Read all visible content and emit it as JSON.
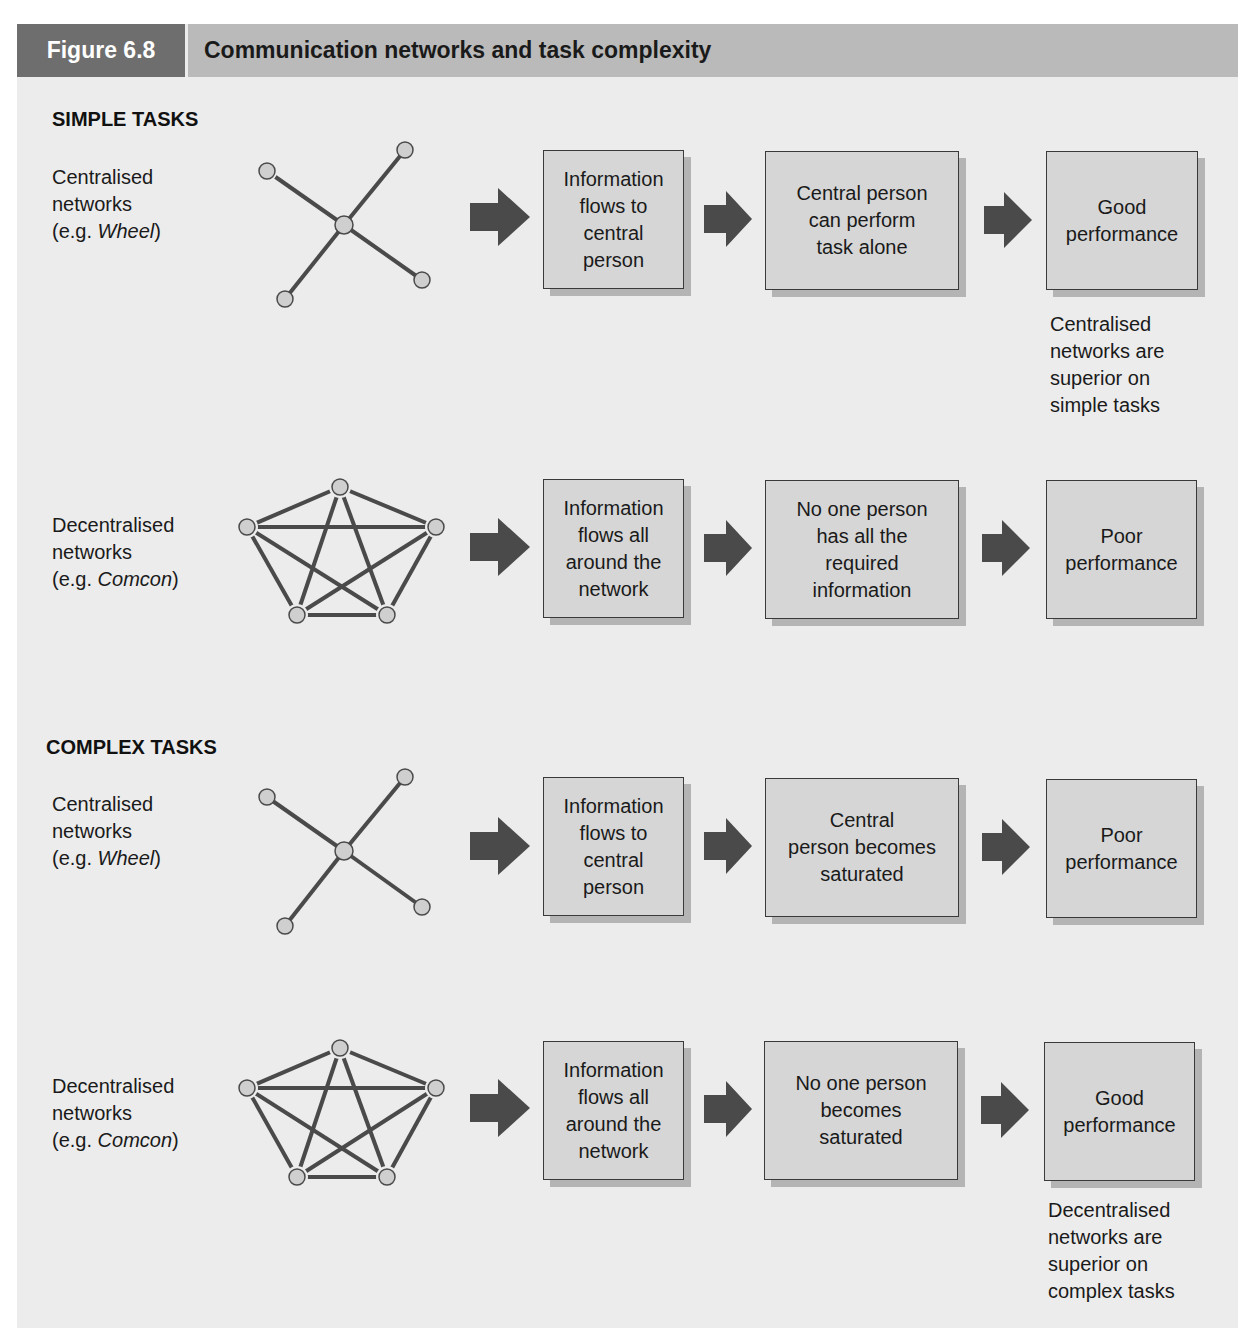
{
  "header": {
    "figure_number": "Figure 6.8",
    "title": "Communication networks and task complexity"
  },
  "colors": {
    "panel_bg": "#ececec",
    "header_dark": "#6e6e6e",
    "header_light": "#bababa",
    "box_fill": "#d6d6d6",
    "arrow": "#4a4a4a",
    "node_fill": "#cfcfcf",
    "edge": "#4a4a4a"
  },
  "sections": [
    {
      "label": "SIMPLE TASKS",
      "rows": [
        {
          "network": {
            "line1": "Centralised",
            "line2": "networks",
            "eg_prefix": "(e.g. ",
            "eg_name": "Wheel",
            "eg_suffix": ")",
            "type": "wheel"
          },
          "steps": [
            "Information\nflows to\ncentral\nperson",
            "Central person\ncan perform\ntask alone",
            "Good\nperformance"
          ],
          "note": "Centralised\nnetworks are\nsuperior on\nsimple tasks"
        },
        {
          "network": {
            "line1": "Decentralised",
            "line2": "networks",
            "eg_prefix": "(e.g. ",
            "eg_name": "Comcon",
            "eg_suffix": ")",
            "type": "comcon"
          },
          "steps": [
            "Information\nflows all\naround the\nnetwork",
            "No one person\nhas all the\nrequired\ninformation",
            "Poor\nperformance"
          ]
        }
      ]
    },
    {
      "label": "COMPLEX TASKS",
      "rows": [
        {
          "network": {
            "line1": "Centralised",
            "line2": "networks",
            "eg_prefix": "(e.g. ",
            "eg_name": "Wheel",
            "eg_suffix": ")",
            "type": "wheel"
          },
          "steps": [
            "Information\nflows to\ncentral\nperson",
            "Central\nperson becomes\nsaturated",
            "Poor\nperformance"
          ]
        },
        {
          "network": {
            "line1": "Decentralised",
            "line2": "networks",
            "eg_prefix": "(e.g. ",
            "eg_name": "Comcon",
            "eg_suffix": ")",
            "type": "comcon"
          },
          "steps": [
            "Information\nflows all\naround the\nnetwork",
            "No one person\nbecomes\nsaturated",
            "Good\nperformance"
          ],
          "note": "Decentralised\nnetworks are\nsuperior on\ncomplex tasks"
        }
      ]
    }
  ]
}
